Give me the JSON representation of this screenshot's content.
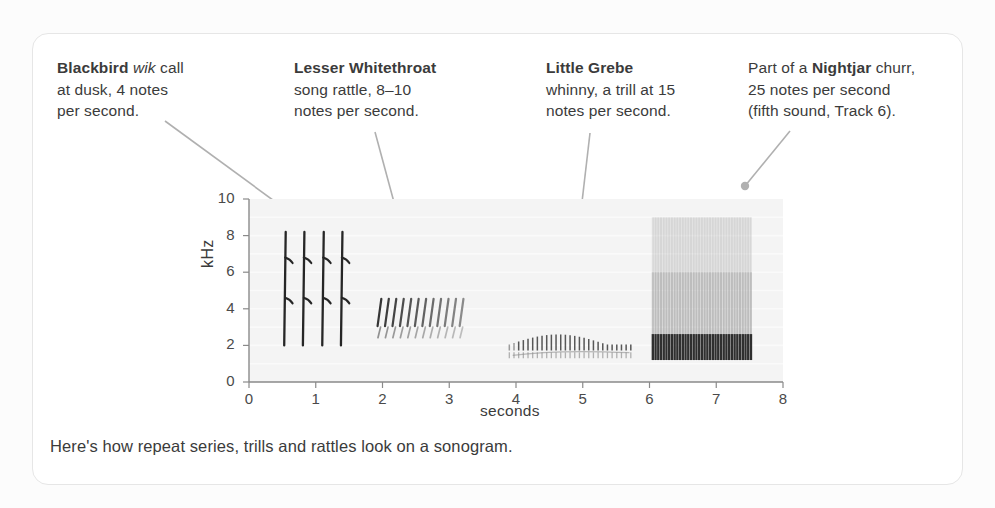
{
  "card": {
    "background": "#ffffff",
    "border_color": "#e6e6e6"
  },
  "annotations": [
    {
      "id": "blackbird",
      "species": "Blackbird",
      "emphasis": "wik",
      "text_after_emphasis": " call",
      "line2": "at dusk, 4 notes",
      "line3": "per second.",
      "notes_per_second": 4
    },
    {
      "id": "whitethroat",
      "species": "Lesser Whitethroat",
      "line2": "song rattle, 8–10",
      "line3": "notes per second.",
      "notes_per_second": "8-10"
    },
    {
      "id": "grebe",
      "species": "Little Grebe",
      "line2": "whinny, a trill at 15",
      "line3": "notes per second.",
      "notes_per_second": 15
    },
    {
      "id": "nightjar",
      "prefix": "Part of a ",
      "species": "Nightjar",
      "suffix": " churr,",
      "line2": "25 notes per second",
      "line3": "(fifth sound, Track 6).",
      "notes_per_second": 25,
      "track": "Track 6"
    }
  ],
  "caption": "Here's how repeat series, trills and rattles look on a sonogram.",
  "chart_data": {
    "type": "heatmap",
    "title": "",
    "subtitle": "",
    "xlabel": "seconds",
    "ylabel": "kHz",
    "xlim": [
      0,
      8
    ],
    "ylim": [
      0,
      10
    ],
    "xticks": [
      0,
      1,
      2,
      3,
      4,
      5,
      6,
      7,
      8
    ],
    "yticks": [
      0,
      2,
      4,
      6,
      8,
      10
    ],
    "grid": false,
    "legend": "none",
    "plot_background": "#f4f4f4",
    "trace_color": "#2b2b2b",
    "series": [
      {
        "name": "Blackbird wik call",
        "pattern": "repeat series",
        "notes_per_second": 4,
        "t_start": 0.55,
        "t_end": 1.42,
        "note_count": 4,
        "note_times": [
          0.55,
          0.83,
          1.12,
          1.4
        ],
        "freq_low": 2.0,
        "freq_high": 8.2,
        "description": "four near-vertical strokes with small barbs at 4.6 and 6.8 kHz"
      },
      {
        "name": "Lesser Whitethroat song rattle",
        "pattern": "rattle",
        "notes_per_second": 9,
        "t_start": 1.95,
        "t_end": 3.18,
        "note_count": 12,
        "freq_low": 2.4,
        "freq_high": 4.6,
        "description": "dense slanted strokes 3.0-4.5 kHz with fainter lower band near 2.6 kHz"
      },
      {
        "name": "Little Grebe whinny",
        "pattern": "trill",
        "notes_per_second": 15,
        "t_start": 3.9,
        "t_end": 5.72,
        "note_count": 27,
        "freq_low": 1.3,
        "freq_high": 2.7,
        "description": "fine arching comb peaking near 2.6 kHz with faint lower band near 1.6 kHz"
      },
      {
        "name": "Nightjar churr",
        "pattern": "churr",
        "notes_per_second": 25,
        "t_start": 6.05,
        "t_end": 7.52,
        "note_count": 37,
        "freq_low": 1.2,
        "freq_high": 9.0,
        "description": "broad block of vertical striations, dark 1.2-2.6 kHz fading upward to 9 kHz"
      }
    ],
    "leaders": [
      {
        "from": [
          165,
          121
        ],
        "to": [
          303,
          222
        ],
        "target": "Blackbird wik call"
      },
      {
        "from": [
          375,
          132
        ],
        "to": [
          411,
          265
        ],
        "target": "Lesser Whitethroat song rattle"
      },
      {
        "from": [
          590,
          133
        ],
        "to": [
          569,
          314
        ],
        "target": "Little Grebe whinny"
      },
      {
        "from": [
          790,
          131
        ],
        "to": [
          745,
          186
        ],
        "target": "Nightjar churr"
      }
    ]
  }
}
